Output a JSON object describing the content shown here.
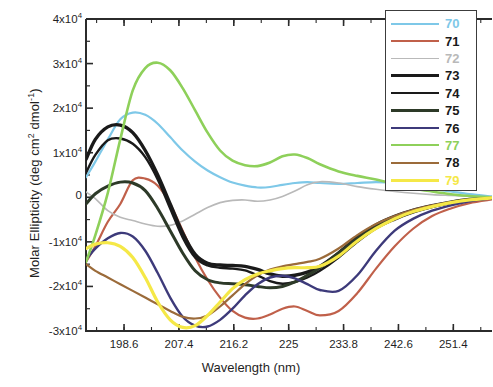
{
  "chart_data": {
    "type": "line",
    "title": "",
    "xlabel": "Wavelength (nm)",
    "ylabel": "Molar Ellipticity (deg cm2 dmol-1)",
    "ylabel_parts": {
      "prefix": "Molar Ellipticity (deg cm",
      "sup1": "2",
      "mid": " dmol",
      "sup2": "-1",
      "suffix": ")"
    },
    "xlim": [
      192.5,
      257.6
    ],
    "ylim": [
      -30000,
      40000
    ],
    "grid": false,
    "legend_position": "top-right",
    "xticks": [
      198.6,
      207.4,
      216.2,
      225,
      233.8,
      242.6,
      251.4
    ],
    "xtick_labels": [
      "198.6",
      "207.4",
      "216.2",
      "225",
      "233.8",
      "242.6",
      "251.4"
    ],
    "yticks": [
      40000,
      30000,
      20000,
      10000,
      0,
      -10000,
      -20000,
      -30000
    ],
    "ytick_labels": [
      {
        "prefix": "4x10",
        "exp": "4"
      },
      {
        "prefix": "3x10",
        "exp": "4"
      },
      {
        "prefix": "2x10",
        "exp": "4"
      },
      {
        "prefix": "1x10",
        "exp": "4"
      },
      {
        "prefix": "0",
        "exp": ""
      },
      {
        "prefix": "-1x10",
        "exp": "4"
      },
      {
        "prefix": "-2x10",
        "exp": "4"
      },
      {
        "prefix": "-3x10",
        "exp": "4"
      }
    ],
    "series": [
      {
        "name": "70",
        "color": "#7ec8e8",
        "width": 2.2,
        "x": [
          192.5,
          194,
          196,
          198,
          200,
          202,
          204,
          206,
          208,
          210,
          212,
          214,
          216,
          218,
          220,
          222,
          224,
          226,
          228,
          230,
          233,
          236,
          239,
          242,
          245,
          248,
          251,
          254,
          257.6
        ],
        "values": [
          4500,
          8000,
          13000,
          17500,
          19000,
          18500,
          16500,
          13500,
          10500,
          8000,
          6000,
          4500,
          3300,
          2600,
          2200,
          2300,
          2800,
          3200,
          3400,
          3200,
          3000,
          3200,
          3400,
          3200,
          2600,
          1900,
          1300,
          700,
          200
        ]
      },
      {
        "name": "71",
        "color": "#c0604a",
        "width": 2.2,
        "x": [
          192.5,
          194,
          196,
          198,
          200,
          202,
          204,
          206,
          208,
          210,
          212,
          214,
          216,
          218,
          220,
          222,
          224,
          226,
          228,
          230,
          233,
          236,
          239,
          242,
          245,
          248,
          251,
          254,
          257.6
        ],
        "values": [
          -14500,
          -11000,
          -5500,
          -1500,
          3800,
          4200,
          2600,
          -1500,
          -7500,
          -13500,
          -18500,
          -22500,
          -25500,
          -27000,
          -27200,
          -26300,
          -25000,
          -24500,
          -25500,
          -26500,
          -25500,
          -21500,
          -16000,
          -11000,
          -7000,
          -4200,
          -2500,
          -1300,
          -500
        ]
      },
      {
        "name": "72",
        "color": "#b9b9b9",
        "width": 1.6,
        "x": [
          192.5,
          194,
          196,
          198,
          200,
          202,
          204,
          206,
          208,
          210,
          212,
          214,
          216,
          218,
          220,
          222,
          224,
          226,
          228,
          230,
          233,
          236,
          239,
          242,
          245,
          248,
          251,
          254,
          257.6
        ],
        "values": [
          1200,
          -300,
          -3000,
          -4500,
          -5200,
          -6000,
          -6500,
          -6300,
          -5300,
          -3800,
          -2300,
          -1200,
          -700,
          -600,
          -900,
          -600,
          200,
          1400,
          2800,
          3500,
          3200,
          2400,
          1800,
          1300,
          900,
          600,
          400,
          200,
          0
        ]
      },
      {
        "name": "73",
        "color": "#1a1a1a",
        "width": 3.4,
        "x": [
          192.5,
          194,
          196,
          198,
          200,
          202,
          204,
          206,
          208,
          210,
          212,
          214,
          216,
          218,
          220,
          222,
          224,
          226,
          228,
          230,
          233,
          236,
          239,
          242,
          245,
          248,
          251,
          254,
          257.6
        ],
        "values": [
          8500,
          13000,
          15800,
          16200,
          14500,
          10500,
          5000,
          -1500,
          -8000,
          -12800,
          -14800,
          -15200,
          -15300,
          -15500,
          -16200,
          -17200,
          -17700,
          -17500,
          -16800,
          -15500,
          -12500,
          -9000,
          -6200,
          -4300,
          -2900,
          -1900,
          -1100,
          -500,
          -100
        ]
      },
      {
        "name": "74",
        "color": "#1a1a1a",
        "width": 2.4,
        "x": [
          192.5,
          194,
          196,
          198,
          200,
          202,
          204,
          206,
          208,
          210,
          212,
          214,
          216,
          218,
          220,
          222,
          224,
          226,
          228,
          230,
          233,
          236,
          239,
          242,
          245,
          248,
          251,
          254,
          257.6
        ],
        "values": [
          5500,
          9500,
          12800,
          13200,
          12000,
          9000,
          4000,
          -2500,
          -9000,
          -13500,
          -15300,
          -15800,
          -16000,
          -16400,
          -17500,
          -18800,
          -19400,
          -19000,
          -18000,
          -16500,
          -13500,
          -10000,
          -7000,
          -5000,
          -3400,
          -2200,
          -1300,
          -600,
          -150
        ]
      },
      {
        "name": "75",
        "color": "#2d3a28",
        "width": 3.0,
        "x": [
          192.5,
          194,
          196,
          198,
          200,
          202,
          204,
          206,
          208,
          210,
          212,
          214,
          216,
          218,
          220,
          222,
          224,
          226,
          228,
          230,
          233,
          236,
          239,
          242,
          245,
          248,
          251,
          254,
          257.6
        ],
        "values": [
          -1500,
          800,
          2500,
          3400,
          3200,
          1500,
          -2500,
          -7500,
          -12500,
          -16500,
          -18500,
          -19200,
          -19400,
          -19600,
          -20000,
          -20300,
          -20000,
          -19000,
          -17500,
          -15800,
          -12500,
          -9200,
          -6600,
          -4700,
          -3200,
          -2100,
          -1200,
          -600,
          -150
        ]
      },
      {
        "name": "76",
        "color": "#3d3a7a",
        "width": 2.4,
        "x": [
          192.5,
          194,
          196,
          198,
          200,
          202,
          204,
          206,
          208,
          210,
          212,
          214,
          216,
          218,
          220,
          222,
          224,
          226,
          228,
          230,
          233,
          236,
          239,
          242,
          245,
          248,
          251,
          254,
          257.6
        ],
        "values": [
          -14000,
          -11500,
          -9200,
          -8000,
          -8800,
          -12000,
          -17000,
          -22500,
          -26800,
          -28800,
          -29000,
          -27500,
          -25000,
          -22000,
          -19500,
          -18000,
          -17600,
          -18200,
          -19500,
          -20800,
          -21000,
          -17500,
          -12000,
          -7500,
          -4800,
          -3000,
          -1800,
          -900,
          -250
        ]
      },
      {
        "name": "77",
        "color": "#8ed05a",
        "width": 2.6,
        "x": [
          192.5,
          194,
          196,
          198,
          200,
          202,
          204,
          206,
          208,
          210,
          212,
          214,
          216,
          218,
          220,
          222,
          224,
          226,
          228,
          230,
          233,
          236,
          239,
          242,
          245,
          248,
          251,
          254,
          257.6
        ],
        "values": [
          -14500,
          -8500,
          1000,
          13000,
          24000,
          29000,
          30200,
          28500,
          24500,
          19500,
          14500,
          10500,
          8200,
          7200,
          7000,
          7800,
          9200,
          9600,
          8800,
          7400,
          5800,
          4800,
          4000,
          3000,
          2000,
          1300,
          700,
          300,
          0
        ]
      },
      {
        "name": "78",
        "color": "#9b6b3a",
        "width": 2.2,
        "x": [
          192.5,
          194,
          196,
          198,
          200,
          202,
          204,
          206,
          208,
          210,
          212,
          214,
          216,
          218,
          220,
          222,
          224,
          226,
          228,
          230,
          233,
          236,
          239,
          242,
          245,
          248,
          251,
          254,
          257.6
        ],
        "values": [
          -15000,
          -16500,
          -18000,
          -19500,
          -21000,
          -22500,
          -24000,
          -25500,
          -26800,
          -27200,
          -26500,
          -24500,
          -22000,
          -19500,
          -17500,
          -16200,
          -15500,
          -15000,
          -14500,
          -13800,
          -11500,
          -8500,
          -6000,
          -4200,
          -2800,
          -1800,
          -1100,
          -500,
          -100
        ]
      },
      {
        "name": "79",
        "color": "#f5e847",
        "width": 3.2,
        "x": [
          192.5,
          194,
          196,
          198,
          200,
          202,
          204,
          206,
          208,
          210,
          212,
          214,
          216,
          218,
          220,
          222,
          224,
          226,
          228,
          230,
          233,
          236,
          239,
          242,
          245,
          248,
          251,
          254,
          257.6
        ],
        "values": [
          -11500,
          -10500,
          -10200,
          -11000,
          -13500,
          -18000,
          -23500,
          -27500,
          -29200,
          -28800,
          -26500,
          -23500,
          -20500,
          -18500,
          -17200,
          -16500,
          -16000,
          -15800,
          -15800,
          -15500,
          -13200,
          -9800,
          -7000,
          -4800,
          -3200,
          -2100,
          -1200,
          -600,
          -150
        ]
      }
    ]
  },
  "legend": {
    "entries": [
      {
        "label": "70"
      },
      {
        "label": "71"
      },
      {
        "label": "72"
      },
      {
        "label": "73"
      },
      {
        "label": "74"
      },
      {
        "label": "75"
      },
      {
        "label": "76"
      },
      {
        "label": "77"
      },
      {
        "label": "78"
      },
      {
        "label": "79"
      }
    ]
  }
}
